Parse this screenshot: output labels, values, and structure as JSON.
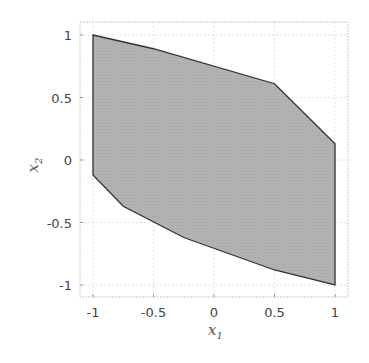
{
  "chart_data": {
    "type": "area",
    "title": "",
    "xlabel": "x_1",
    "ylabel": "x_2",
    "xlim": [
      -1.1,
      1.1
    ],
    "ylim": [
      -1.1,
      1.1
    ],
    "xticks": [
      -1,
      -0.5,
      0,
      0.5,
      1
    ],
    "yticks": [
      -1,
      -0.5,
      0,
      0.5,
      1
    ],
    "xtick_labels": [
      "-1",
      "-0.5",
      "0",
      "0.5",
      "1"
    ],
    "ytick_labels": [
      "-1",
      "-0.5",
      "0",
      "0.5",
      "1"
    ],
    "grid": true,
    "legend": null,
    "fill_color": "#b4b4b4",
    "edge_color": "#333333",
    "polygon": {
      "x": [
        -1,
        -0.5,
        0.5,
        0.75,
        1,
        1,
        0.5,
        -0.25,
        -0.75,
        -1
      ],
      "y": [
        1,
        0.89,
        0.61,
        0.37,
        0.13,
        -1,
        -0.88,
        -0.62,
        -0.37,
        -0.12
      ]
    }
  },
  "labels": {
    "x_main": "x",
    "x_sub": "1",
    "y_main": "x",
    "y_sub": "2"
  }
}
